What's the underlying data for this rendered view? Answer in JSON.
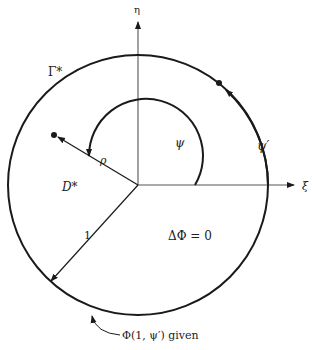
{
  "diagram": {
    "axes": {
      "horizontal_label": "ξ",
      "vertical_label": "η"
    },
    "boundary_label": "Γ*",
    "domain_label": "D*",
    "equation": "ΔΦ = 0",
    "radius_label": "1",
    "rho_label": "ρ",
    "psi_label": "ψ",
    "psi_prime_label": "ψ′",
    "boundary_condition": "Φ(1, ψ′) given",
    "colors": {
      "stroke": "#1a1a1a",
      "axis": "#555555",
      "background": "#ffffff"
    }
  }
}
